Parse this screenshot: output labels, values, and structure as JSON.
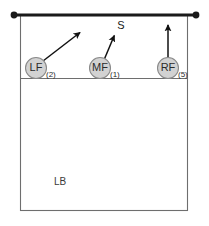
{
  "diagram": {
    "kind": "volleyball-court-rotation",
    "width": 209,
    "height": 226,
    "background_color": "#ffffff"
  },
  "colors": {
    "net": "#1a1a1a",
    "post_dot": "#1a1a1a",
    "court_line": "#6e6e6e",
    "attack_line": "#6e6e6e",
    "player_fill": "#d2d2d2",
    "player_stroke": "#8a8a8a",
    "arrow": "#111111",
    "text": "#2b2b2b"
  },
  "net": {
    "name": "net",
    "y": 15,
    "x_start": 14,
    "x_end": 196,
    "thickness": 3.2
  },
  "posts": [
    {
      "name": "left-post",
      "cx": 14,
      "cy": 15,
      "r": 3.4
    },
    {
      "name": "right-post",
      "cx": 196,
      "cy": 15,
      "r": 3.4
    }
  ],
  "court": {
    "name": "court-outline",
    "x": 20,
    "y": 15,
    "width": 168,
    "height": 196,
    "stroke_width": 1.1
  },
  "attack_line": {
    "name": "attack-line",
    "y": 78,
    "x_start": 20,
    "x_end": 188,
    "stroke_width": 1.1
  },
  "players": [
    {
      "id": "LF",
      "label": "LF",
      "number": "(2)",
      "cx": 36,
      "cy": 68,
      "r": 10.5,
      "number_x": 46,
      "number_y": 74
    },
    {
      "id": "MF",
      "label": "MF",
      "number": "(1)",
      "cx": 100,
      "cy": 68,
      "r": 10.5,
      "number_x": 110,
      "number_y": 74
    },
    {
      "id": "RF",
      "label": "RF",
      "number": "(5)",
      "cx": 168,
      "cy": 68,
      "r": 10.5,
      "number_x": 178,
      "number_y": 74
    }
  ],
  "arrows": [
    {
      "name": "lf-movement-arrow",
      "from_x": 43,
      "from_y": 61,
      "to_x": 82,
      "to_y": 31
    },
    {
      "name": "mf-movement-arrow",
      "from_x": 104,
      "from_y": 60,
      "to_x": 115,
      "to_y": 34
    },
    {
      "name": "rf-movement-arrow",
      "from_x": 168,
      "from_y": 58,
      "to_x": 168,
      "to_y": 23
    }
  ],
  "annotations": [
    {
      "name": "setter-label",
      "text": "S",
      "x": 121,
      "y": 26
    }
  ],
  "zones": [
    {
      "name": "left-back-zone-label",
      "text": "LB",
      "x": 60,
      "y": 182
    }
  ]
}
